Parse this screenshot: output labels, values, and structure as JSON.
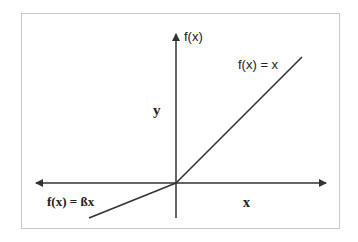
{
  "diagram": {
    "type": "activation-function-plot",
    "axes": {
      "y_axis_label": "f(x)",
      "y_side_label": "y",
      "x_side_label": "x"
    },
    "pieces": [
      {
        "name": "positive",
        "label": "f(x) = x"
      },
      {
        "name": "negative",
        "label": "f(x) = ßx"
      }
    ],
    "colors": {
      "line": "#333333",
      "border": "#c8c8c8",
      "background": "#ffffff"
    }
  }
}
